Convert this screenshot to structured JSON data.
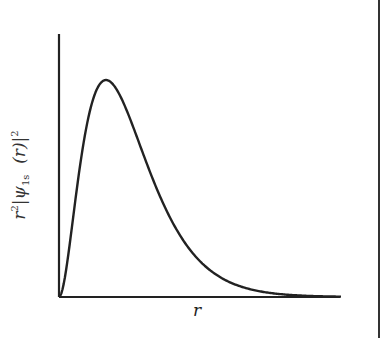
{
  "chart_data": {
    "type": "line",
    "title": "",
    "xlabel": "r",
    "ylabel": "r²|ψ1s (r)|²",
    "x": [
      0,
      0.25,
      0.5,
      0.75,
      1.0,
      1.25,
      1.5,
      1.75,
      2.0,
      2.5,
      3.0,
      3.5,
      4.0,
      4.5,
      5.0,
      5.5,
      6.0
    ],
    "series": [
      {
        "name": "r²|ψ1s(r)|²",
        "values": [
          0,
          0.28,
          0.68,
          0.93,
          1.0,
          0.94,
          0.83,
          0.69,
          0.54,
          0.31,
          0.165,
          0.083,
          0.04,
          0.018,
          0.008,
          0.004,
          0.002
        ]
      }
    ],
    "xlim": [
      0,
      6
    ],
    "ylim": [
      0,
      1.2
    ],
    "grid": false,
    "legend": null,
    "ticks": "none"
  },
  "labels": {
    "ylabel_base": "r",
    "ylabel_sup": "2",
    "ylabel_psi": "ψ",
    "ylabel_sub": "1s",
    "ylabel_arg": "(r)",
    "ylabel_sup2": "2",
    "xlabel": "r"
  }
}
